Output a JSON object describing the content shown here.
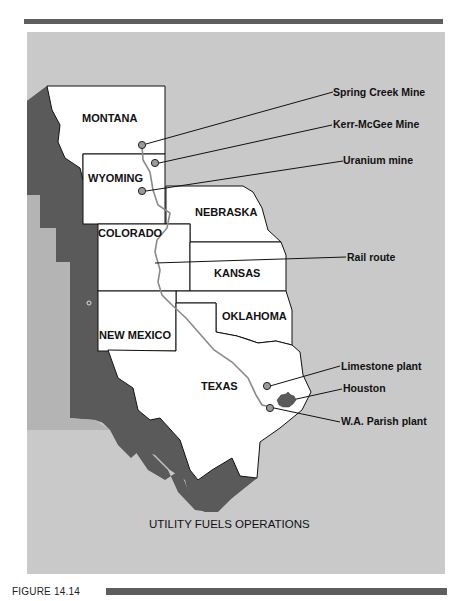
{
  "figure": {
    "label": "FIGURE 14.14",
    "title": "UTILITY FUELS OPERATIONS"
  },
  "colors": {
    "panel_background": "#c9c9c9",
    "dark_region": "#5a5a5a",
    "state_fill": "#ffffff",
    "rail_route": "#8a8a8a",
    "marker_fill": "#9a9a9a",
    "rule": "#5e5e5e"
  },
  "states": [
    {
      "name": "MONTANA"
    },
    {
      "name": "WYOMING"
    },
    {
      "name": "NEBRASKA"
    },
    {
      "name": "COLORADO"
    },
    {
      "name": "KANSAS"
    },
    {
      "name": "OKLAHOMA"
    },
    {
      "name": "NEW MEXICO"
    },
    {
      "name": "TEXAS"
    }
  ],
  "callouts": [
    {
      "label": "Spring Creek Mine",
      "type": "mine"
    },
    {
      "label": "Kerr-McGee Mine",
      "type": "mine"
    },
    {
      "label": "Uranium mine",
      "type": "mine"
    },
    {
      "label": "Rail route",
      "type": "route"
    },
    {
      "label": "Limestone plant",
      "type": "plant"
    },
    {
      "label": "Houston",
      "type": "city"
    },
    {
      "label": "W.A. Parish plant",
      "type": "plant"
    }
  ]
}
